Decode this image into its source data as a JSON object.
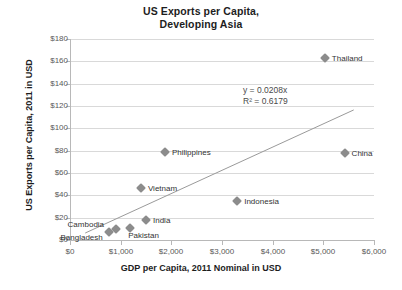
{
  "chart_data": {
    "type": "scatter",
    "title": "US Exports per Capita, Developing Asia",
    "title_line1": "US Exports per Capita,",
    "title_line2": "Developing Asia",
    "xlabel": "GDP per Capita, 2011 Nominal in USD",
    "ylabel": "US Exports per Capita, 2011 in USD",
    "xlim": [
      0,
      6000
    ],
    "ylim": [
      0,
      180
    ],
    "grid": true,
    "legend": "none",
    "x_ticks": [
      "$0",
      "$1,000",
      "$2,000",
      "$3,000",
      "$4,000",
      "$5,000",
      "$6,000"
    ],
    "x_tick_values": [
      0,
      1000,
      2000,
      3000,
      4000,
      5000,
      6000
    ],
    "y_ticks": [
      "$0",
      "$20",
      "$40",
      "$60",
      "$80",
      "$100",
      "$120",
      "$140",
      "$160",
      "$180"
    ],
    "y_tick_values": [
      0,
      20,
      40,
      60,
      80,
      100,
      120,
      140,
      160,
      180
    ],
    "points": [
      {
        "label": "Thailand",
        "x": 5030,
        "y": 163
      },
      {
        "label": "China",
        "x": 5420,
        "y": 78
      },
      {
        "label": "Philippines",
        "x": 1875,
        "y": 79
      },
      {
        "label": "Vietnam",
        "x": 1400,
        "y": 47
      },
      {
        "label": "Indonesia",
        "x": 3300,
        "y": 35
      },
      {
        "label": "India",
        "x": 1500,
        "y": 18
      },
      {
        "label": "Pakistan",
        "x": 1190,
        "y": 11
      },
      {
        "label": "Cambodia",
        "x": 900,
        "y": 10
      },
      {
        "label": "Bangladesh",
        "x": 760,
        "y": 7
      }
    ],
    "trendline": {
      "equation": "y = 0.0208x",
      "r_squared": "R² = 0.6179",
      "slope": 0.0208,
      "intercept": 0,
      "x_start": 300,
      "x_end": 5600
    },
    "marker_color": "#8c8c8c",
    "grid_color": "#d9d9d9",
    "axis_color": "#b8b8b8",
    "text_color": "#333333"
  }
}
